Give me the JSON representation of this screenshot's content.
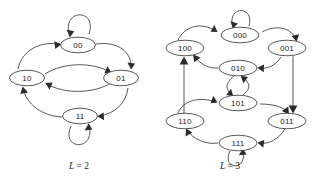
{
  "figure": {
    "kind": "de-bruijn-graph-pair",
    "background": "#ffffff",
    "stroke_color": "#3a3a3a",
    "arrow_color": "#2b2b2b",
    "label_color": "#1a1a1a"
  },
  "diagrams": [
    {
      "id": "left",
      "caption_prefix": "L",
      "caption_eq": " = ",
      "caption_value": "2",
      "caption_text": "L = 2",
      "nodes": [
        {
          "id": "n00",
          "label": "00",
          "cx": 78,
          "cy": 45
        },
        {
          "id": "n10",
          "label": "10",
          "cx": 27,
          "cy": 78
        },
        {
          "id": "n01",
          "label": "01",
          "cx": 121,
          "cy": 78
        },
        {
          "id": "n11",
          "label": "11",
          "cx": 80,
          "cy": 116
        }
      ],
      "edges": [
        {
          "from": "00",
          "to": "00",
          "type": "self-loop"
        },
        {
          "from": "00",
          "to": "01",
          "type": "arc"
        },
        {
          "from": "01",
          "to": "11",
          "type": "arc"
        },
        {
          "from": "11",
          "to": "10",
          "type": "arc"
        },
        {
          "from": "10",
          "to": "00",
          "type": "arc"
        },
        {
          "from": "10",
          "to": "01",
          "type": "arc"
        },
        {
          "from": "01",
          "to": "10",
          "type": "arc"
        },
        {
          "from": "11",
          "to": "11",
          "type": "self-loop"
        }
      ]
    },
    {
      "id": "right",
      "caption_prefix": "L",
      "caption_eq": " = ",
      "caption_value": "3",
      "caption_text": "L = 3",
      "nodes": [
        {
          "id": "n000",
          "label": "000",
          "cx": 240,
          "cy": 35
        },
        {
          "id": "n100",
          "label": "100",
          "cx": 185,
          "cy": 48
        },
        {
          "id": "n001",
          "label": "001",
          "cx": 287,
          "cy": 48
        },
        {
          "id": "n010",
          "label": "010",
          "cx": 238,
          "cy": 68
        },
        {
          "id": "n101",
          "label": "101",
          "cx": 238,
          "cy": 103
        },
        {
          "id": "n110",
          "label": "110",
          "cx": 185,
          "cy": 121
        },
        {
          "id": "n011",
          "label": "011",
          "cx": 287,
          "cy": 121
        },
        {
          "id": "n111",
          "label": "111",
          "cx": 238,
          "cy": 143
        }
      ],
      "edges": [
        {
          "from": "000",
          "to": "000",
          "type": "self-loop"
        },
        {
          "from": "100",
          "to": "000",
          "type": "arc"
        },
        {
          "from": "000",
          "to": "001",
          "type": "arc"
        },
        {
          "from": "001",
          "to": "011",
          "type": "line"
        },
        {
          "from": "001",
          "to": "010",
          "type": "arc"
        },
        {
          "from": "010",
          "to": "100",
          "type": "arc"
        },
        {
          "from": "010",
          "to": "101",
          "type": "arc"
        },
        {
          "from": "101",
          "to": "010",
          "type": "arc"
        },
        {
          "from": "101",
          "to": "011",
          "type": "arc"
        },
        {
          "from": "110",
          "to": "101",
          "type": "arc"
        },
        {
          "from": "110",
          "to": "100",
          "type": "line"
        },
        {
          "from": "011",
          "to": "111",
          "type": "arc"
        },
        {
          "from": "111",
          "to": "110",
          "type": "arc"
        },
        {
          "from": "111",
          "to": "111",
          "type": "self-loop"
        }
      ]
    }
  ]
}
